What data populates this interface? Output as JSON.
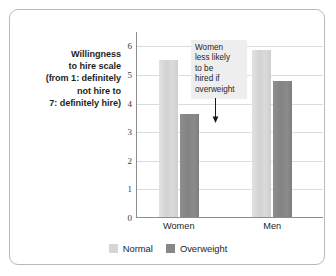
{
  "chart_data": {
    "type": "bar",
    "title": "",
    "xlabel": "",
    "ylabel": "Willingness to hire scale (from 1: definitely not hire to 7: definitely hire)",
    "ylabel_lines": [
      "Willingness",
      "to hire scale",
      "(from 1: definitely",
      "not hire to",
      "7: definitely hire)"
    ],
    "categories": [
      "Women",
      "Men"
    ],
    "series": [
      {
        "name": "Normal",
        "values": [
          5.5,
          5.85
        ],
        "color": "#d6d6d6"
      },
      {
        "name": "Overweight",
        "values": [
          3.6,
          4.75
        ],
        "color": "#878787"
      }
    ],
    "ylim": [
      0,
      6.5
    ],
    "yticks": [
      0,
      1,
      2,
      3,
      4,
      5,
      6
    ],
    "ytick_labels": [
      "0",
      "1",
      "2",
      "3",
      "4",
      "5",
      "6"
    ],
    "grid": true,
    "legend_position": "bottom",
    "annotations": [
      {
        "text_lines": [
          "Women",
          "less likely",
          "to be",
          "hired if",
          "overweight"
        ],
        "text": "Women less likely to be hired if overweight",
        "points_to": {
          "category": "Women",
          "series": "Overweight",
          "value": 3.6
        },
        "arrow": "down-arrow-icon"
      }
    ]
  },
  "legend": {
    "items": [
      {
        "label": "Normal",
        "color": "#d6d6d6"
      },
      {
        "label": "Overweight",
        "color": "#878787"
      }
    ]
  },
  "frame": {
    "border_color": "#b9b9b9",
    "background": "#ffffff"
  }
}
